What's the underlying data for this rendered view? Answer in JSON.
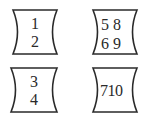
{
  "diagram": {
    "stroke_color": "#2a2a2a",
    "background": "#ffffff",
    "boxes": [
      {
        "id": "box-1",
        "lines": [
          "1",
          "2"
        ]
      },
      {
        "id": "box-2",
        "lines": [
          "5 8",
          "6 9"
        ]
      },
      {
        "id": "box-3",
        "lines": [
          "3",
          "4"
        ]
      },
      {
        "id": "box-4",
        "lines": [
          "710"
        ]
      }
    ]
  }
}
